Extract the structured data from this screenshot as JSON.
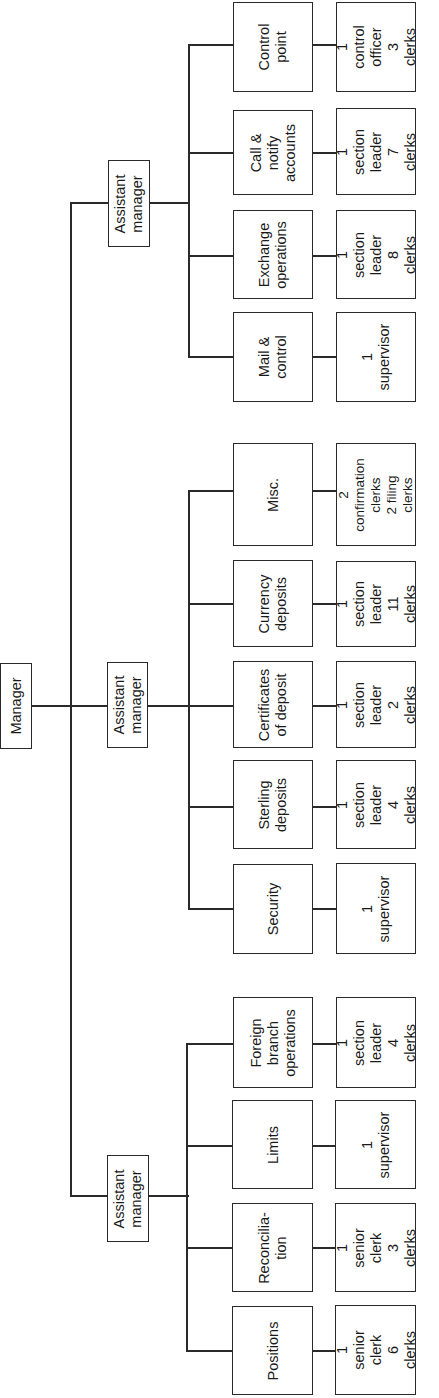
{
  "orientation": "rotated-90-ccw",
  "manager": {
    "label": "Manager"
  },
  "assistant_managers": [
    {
      "label": "Assistant\nmanager",
      "units": [
        {
          "name": "Positions",
          "staff": "1 senior\nclerk\n6 clerks"
        },
        {
          "name": "Reconcilia-\ntion",
          "staff": "1 senior\nclerk\n3 clerks"
        },
        {
          "name": "Limits",
          "staff": "1 supervisor"
        },
        {
          "name": "Foreign\nbranch\noperations",
          "staff": "1 section\nleader\n4 clerks"
        }
      ]
    },
    {
      "label": "Assistant\nmanager",
      "units": [
        {
          "name": "Security",
          "staff": "1 supervisor"
        },
        {
          "name": "Sterling\ndeposits",
          "staff": "1 section\nleader\n4 clerks"
        },
        {
          "name": "Certificates\nof deposit",
          "staff": "1 section\nleader\n2 clerks"
        },
        {
          "name": "Currency\ndeposits",
          "staff": "1 section\nleader\n11 clerks"
        },
        {
          "name": "Misc.",
          "staff": "2 confirmation\nclerks\n2 filing\nclerks"
        }
      ]
    },
    {
      "label": "Assistant\nmanager",
      "units": [
        {
          "name": "Mail &\ncontrol",
          "staff": "1 supervisor"
        },
        {
          "name": "Exchange\noperations",
          "staff": "1 section\nleader\n8 clerks"
        },
        {
          "name": "Call &\nnotify\naccounts",
          "staff": "1 section\nleader\n7 clerks"
        },
        {
          "name": "Control\npoint",
          "staff": "1 control\nofficer\n3 clerks"
        }
      ]
    }
  ],
  "colors": {
    "line": "#2a2a2a",
    "background": "#ffffff",
    "text": "#1a1a1a"
  }
}
